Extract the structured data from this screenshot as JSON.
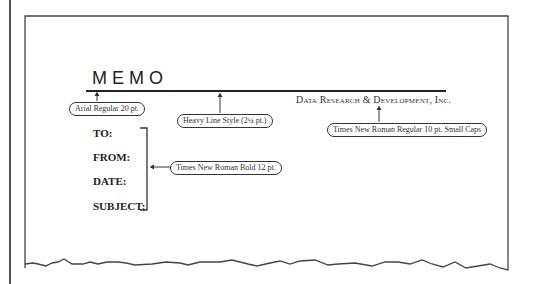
{
  "memo": {
    "title": "MEMO",
    "company": "Data Research & Development, Inc.",
    "fields": [
      "TO:",
      "FROM:",
      "DATE:",
      "SUBJECT:"
    ]
  },
  "callouts": {
    "title_font": "Arial Regular 20 pt.",
    "line_style": "Heavy Line Style (2¼ pt.)",
    "company_font": "Times New Roman Regular 10 pt. Small Caps",
    "field_font": "Times New Roman Bold 12 pt."
  },
  "colors": {
    "line": "#222222",
    "border": "#555555",
    "background": "#ffffff"
  }
}
